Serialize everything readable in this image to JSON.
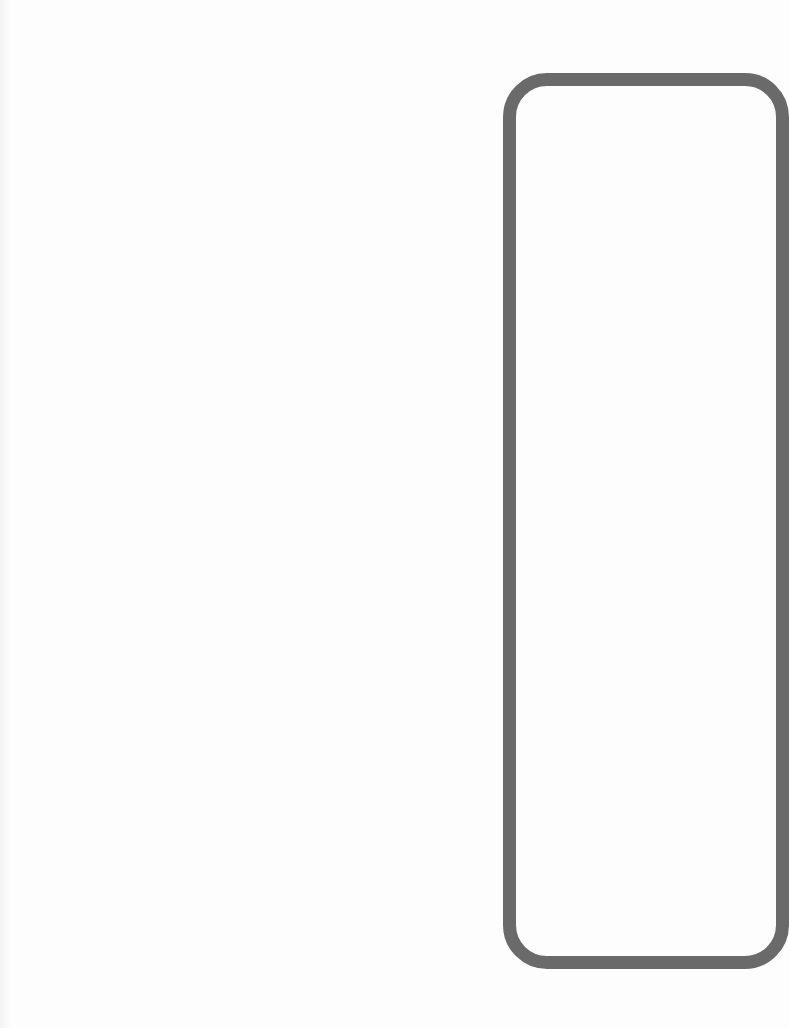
{
  "page": {
    "background": "#fdfdfd",
    "frame_color": "#6a6a6a"
  }
}
